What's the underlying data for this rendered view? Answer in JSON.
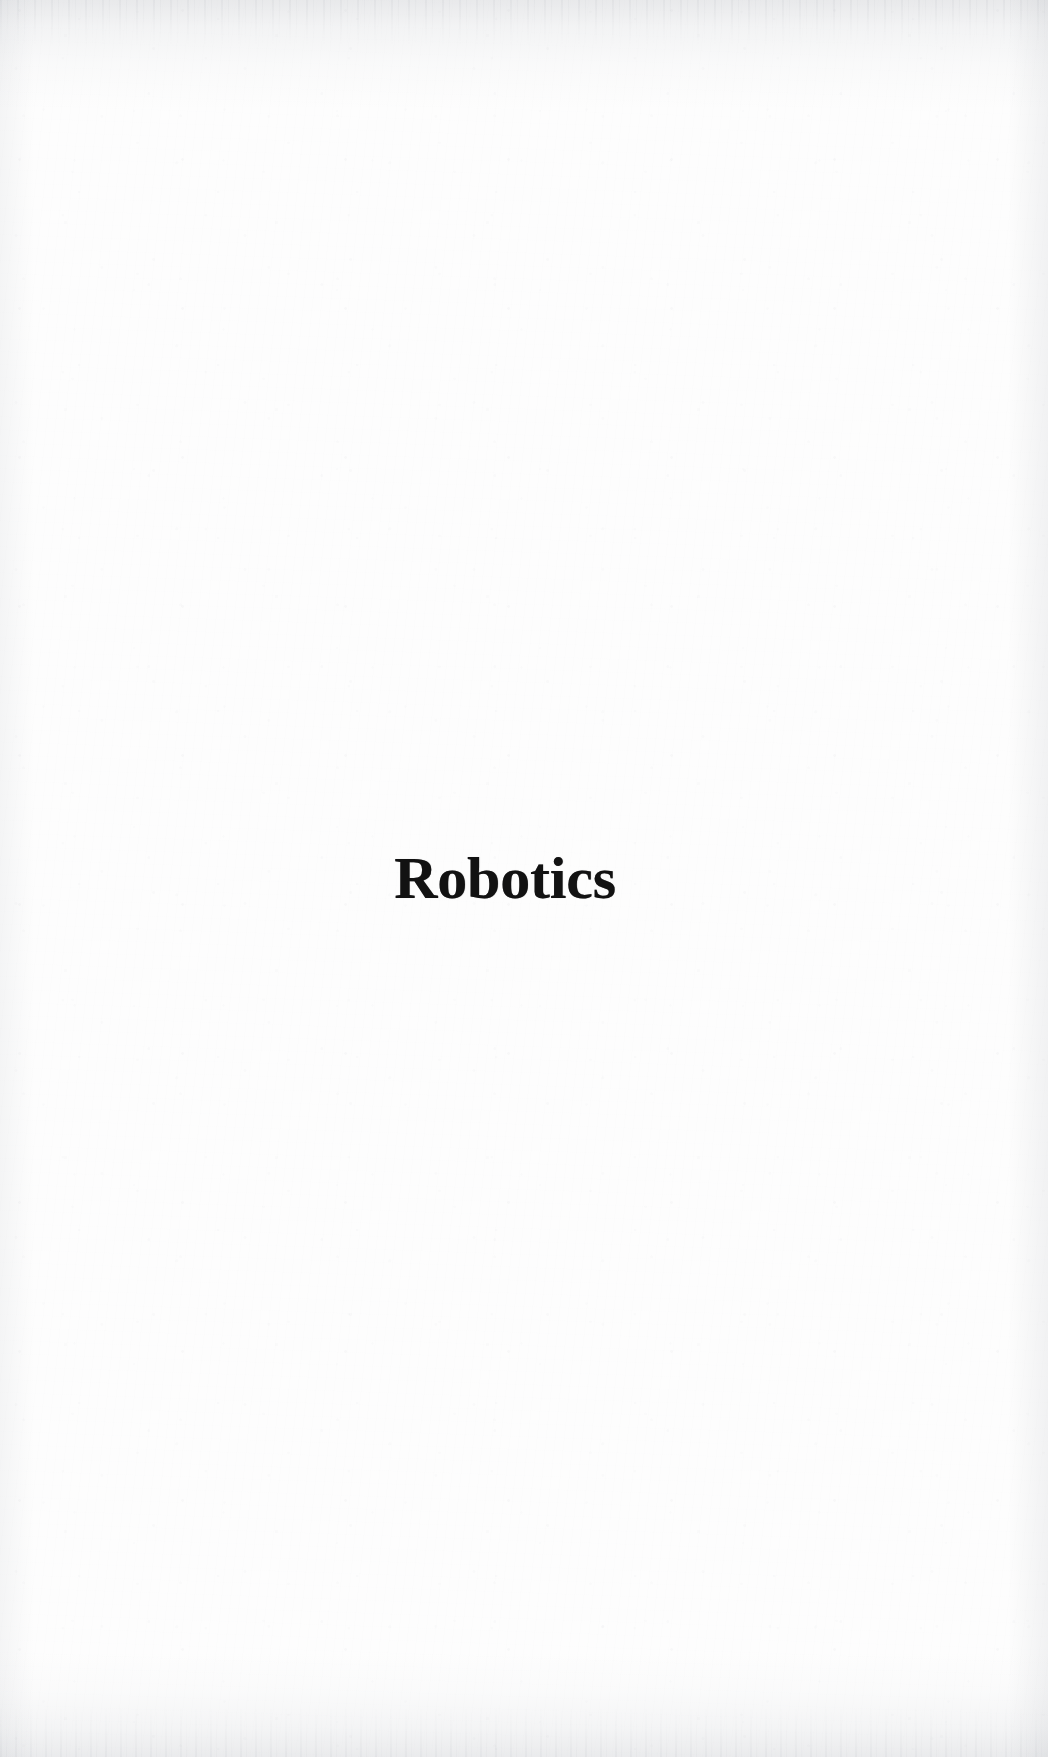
{
  "page": {
    "kind": "book-part-title-page",
    "width": 1048,
    "height": 1757,
    "background_color": "#fdfdfd",
    "ink_color": "#121212"
  },
  "content": {
    "part_title": "Robotics"
  }
}
